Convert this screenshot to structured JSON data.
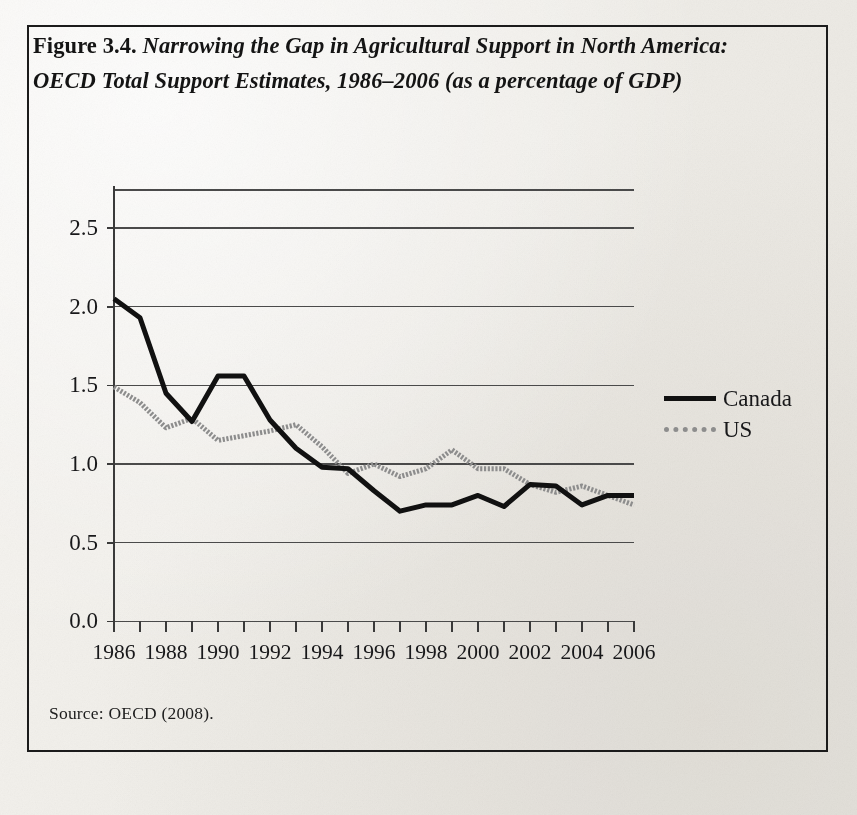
{
  "figure": {
    "number_label": "Figure 3.4.",
    "caption": "Narrowing the Gap in Agricultural Support in North America: OECD Total Support Estimates, 1986–2006 (as a percentage of GDP)",
    "source_note": "Source: OECD (2008).",
    "border_color": "#1b1b1b",
    "background_color": "#f2efe9"
  },
  "legend": {
    "position": "right",
    "entries": [
      {
        "label": "Canada",
        "color": "#111111",
        "style": "solid"
      },
      {
        "label": "US",
        "color": "#8d8d8d",
        "style": "dotted"
      }
    ]
  },
  "chart_data": {
    "type": "line",
    "title": "Narrowing the Gap in Agricultural Support in North America: OECD Total Support Estimates, 1986–2006 (as a percentage of GDP)",
    "xlabel": "",
    "ylabel": "",
    "grid": true,
    "xlim": [
      1986,
      2006
    ],
    "ylim": [
      0.0,
      2.75
    ],
    "ytick_labels": [
      "0.0",
      "0.5",
      "1.0",
      "1.5",
      "2.0",
      "2.5"
    ],
    "ytick_values": [
      0.0,
      0.5,
      1.0,
      1.5,
      2.0,
      2.5
    ],
    "xtick_labels": [
      "1986",
      "1988",
      "1990",
      "1992",
      "1994",
      "1996",
      "1998",
      "2000",
      "2002",
      "2004",
      "2006"
    ],
    "xtick_values": [
      1986,
      1988,
      1990,
      1992,
      1994,
      1996,
      1998,
      2000,
      2002,
      2004,
      2006
    ],
    "x": [
      1986,
      1987,
      1988,
      1989,
      1990,
      1991,
      1992,
      1993,
      1994,
      1995,
      1996,
      1997,
      1998,
      1999,
      2000,
      2001,
      2002,
      2003,
      2004,
      2005,
      2006
    ],
    "series": [
      {
        "name": "Canada",
        "color": "#111111",
        "style": "solid",
        "values": [
          2.05,
          1.93,
          1.45,
          1.27,
          1.56,
          1.56,
          1.28,
          1.1,
          0.98,
          0.97,
          0.83,
          0.7,
          0.74,
          0.74,
          0.8,
          0.73,
          0.87,
          0.86,
          0.74,
          0.8,
          0.8
        ]
      },
      {
        "name": "US",
        "color": "#8d8d8d",
        "style": "dotted",
        "values": [
          1.49,
          1.39,
          1.23,
          1.29,
          1.15,
          1.18,
          1.21,
          1.25,
          1.11,
          0.94,
          1.0,
          0.92,
          0.97,
          1.09,
          0.97,
          0.97,
          0.87,
          0.82,
          0.86,
          0.8,
          0.74
        ]
      }
    ]
  }
}
